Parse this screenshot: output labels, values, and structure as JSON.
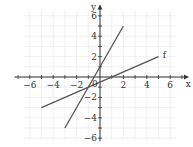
{
  "chart_data": {
    "type": "line",
    "title": "",
    "xlabel": "x",
    "ylabel": "y",
    "xlim": [
      -7,
      7
    ],
    "ylim": [
      -6.5,
      7
    ],
    "grid": true,
    "x_ticks": [
      -6,
      -4,
      -2,
      2,
      4,
      6
    ],
    "x_tick_labels": [
      "−6",
      "−4",
      "−2",
      "2",
      "4",
      "6"
    ],
    "y_ticks": [
      -6,
      -4,
      -2,
      2,
      4,
      6
    ],
    "y_tick_labels": [
      "−6",
      "−4",
      "−2",
      "2",
      "4",
      "6"
    ],
    "origin_label": "0",
    "series": [
      {
        "name": "steep line",
        "label": "",
        "equation": "y = 2x + 1",
        "points": [
          [
            -3,
            -5
          ],
          [
            2,
            5
          ]
        ],
        "color": "#555555"
      },
      {
        "name": "f",
        "label": "f",
        "equation": "y = 0.5x - 0.5",
        "points": [
          [
            -5,
            -3
          ],
          [
            5,
            2
          ]
        ],
        "color": "#555555"
      }
    ],
    "intersection": [
      -1,
      -1
    ],
    "legend": "none"
  },
  "labels": {
    "x_axis": "x",
    "y_axis": "y",
    "origin": "0",
    "line_f": "f"
  },
  "colors": {
    "axis": "#333333",
    "grid": "#e6e6e6",
    "line": "#555555"
  }
}
